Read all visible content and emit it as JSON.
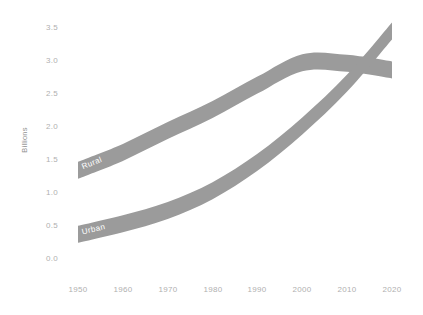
{
  "chart_data": {
    "type": "line",
    "title": "",
    "subtitle": "",
    "xlabel": "",
    "ylabel": "Billions",
    "xlim": [
      1950,
      2020
    ],
    "ylim": [
      0.0,
      3.5
    ],
    "grid": false,
    "legend_position": "inline-band-labels",
    "x": [
      1950,
      1960,
      1970,
      1980,
      1990,
      2000,
      2010,
      2020
    ],
    "xtick_labels": [
      "1950",
      "1960",
      "1970",
      "1980",
      "1990",
      "2000",
      "2010",
      "2020"
    ],
    "ytick_labels": [
      "0.0",
      "0.5",
      "1.0",
      "1.5",
      "2.0",
      "2.5",
      "3.0",
      "3.5"
    ],
    "ytick_values": [
      0.0,
      0.5,
      1.0,
      1.5,
      2.0,
      2.5,
      3.0,
      3.5
    ],
    "series": [
      {
        "name": "Rural",
        "label": "Rural",
        "color": "#9b9b9b",
        "values": [
          1.33,
          1.6,
          1.93,
          2.25,
          2.62,
          2.96,
          2.95,
          2.85
        ]
      },
      {
        "name": "Urban",
        "label": "Urban",
        "color": "#9b9b9b",
        "values": [
          0.36,
          0.52,
          0.72,
          1.02,
          1.45,
          2.0,
          2.65,
          3.44
        ]
      }
    ],
    "annotations": [
      {
        "text": "Rural",
        "series": "Rural",
        "x": 1951,
        "y": 1.38
      },
      {
        "text": "Urban",
        "series": "Urban",
        "x": 1951,
        "y": 0.4
      }
    ]
  },
  "style": {
    "background": "#ffffff",
    "band_color": "#9b9b9b",
    "tick_color": "#b0b0b0",
    "axis_title_color": "#8f8f8f",
    "inline_label_color": "#ffffff"
  }
}
